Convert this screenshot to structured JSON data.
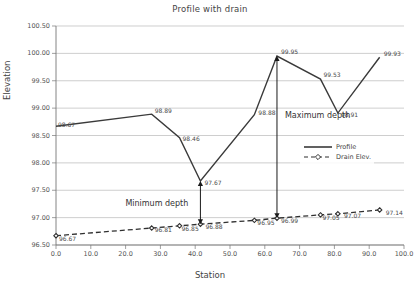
{
  "chart_data": {
    "type": "line",
    "title": "Profile with drain",
    "xlabel": "Station",
    "ylabel": "Elevation",
    "xlim": [
      0,
      100
    ],
    "ylim": [
      96.5,
      100.5
    ],
    "xticks": [
      "0.0",
      "10.0",
      "20.0",
      "30.0",
      "40.0",
      "50.0",
      "60.0",
      "70.0",
      "80.0",
      "90.0",
      "100.0"
    ],
    "yticks": [
      "96.50",
      "97.00",
      "97.50",
      "98.00",
      "98.50",
      "99.00",
      "99.50",
      "100.00",
      "100.50"
    ],
    "grid": "horizontal",
    "legend_position": "inside-right",
    "series": [
      {
        "name": "Profile",
        "style": "solid",
        "color": "#3a3a3a",
        "marker": "none",
        "x": [
          0.0,
          27.5,
          35.5,
          41.5,
          57.0,
          63.5,
          76.0,
          81.0,
          93.0
        ],
        "values": [
          98.67,
          98.89,
          98.46,
          97.67,
          98.88,
          99.95,
          99.53,
          98.91,
          99.93
        ],
        "labels": [
          "98.67",
          "98.89",
          "98.46",
          "97.67",
          "98.88",
          "99.95",
          "99.53",
          "98.91",
          "99.93"
        ]
      },
      {
        "name": "Drain Elev.",
        "style": "dashed",
        "color": "#2f2f2f",
        "marker": "diamond",
        "x": [
          0.0,
          27.5,
          35.5,
          41.5,
          57.0,
          63.5,
          76.0,
          81.0,
          93.0
        ],
        "values": [
          96.67,
          96.81,
          96.85,
          96.88,
          96.95,
          96.99,
          97.05,
          97.07,
          97.14
        ],
        "labels": [
          "96.67",
          "96.81",
          "96.85",
          "96.88",
          "96.95",
          "96.99",
          "97.05",
          "97.07",
          "97.14"
        ]
      }
    ],
    "annotations": [
      {
        "text": "Minimum depth",
        "station": 41.5,
        "top": 97.67,
        "bottom": 96.88
      },
      {
        "text": "Maximum depth",
        "station": 63.5,
        "top": 99.95,
        "bottom": 96.99
      }
    ]
  }
}
